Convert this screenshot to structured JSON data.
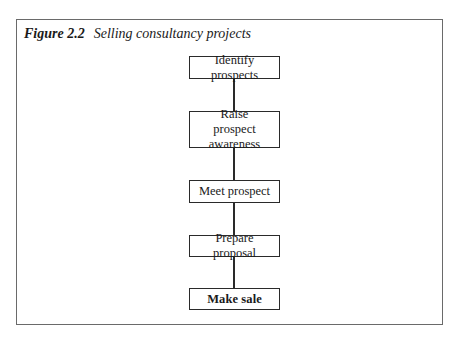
{
  "figure": {
    "number": "Figure 2.2",
    "title": "Selling consultancy projects"
  },
  "flowchart": {
    "direction": "top-to-bottom",
    "steps": [
      {
        "label": "Identify prospects"
      },
      {
        "label": "Raise prospect awareness"
      },
      {
        "label": "Meet prospect"
      },
      {
        "label": "Prepare proposal"
      },
      {
        "label": "Make sale"
      }
    ],
    "connectors": [
      {
        "from": "Identify prospects",
        "to": "Raise prospect awareness"
      },
      {
        "from": "Raise prospect awareness",
        "to": "Meet prospect"
      },
      {
        "from": "Meet prospect",
        "to": "Prepare proposal"
      },
      {
        "from": "Prepare proposal",
        "to": "Make sale"
      }
    ]
  },
  "colors": {
    "frame_border": "#6a6a6a",
    "box_border": "#2a2a2a",
    "text": "#1a1a1a",
    "background": "#ffffff"
  }
}
